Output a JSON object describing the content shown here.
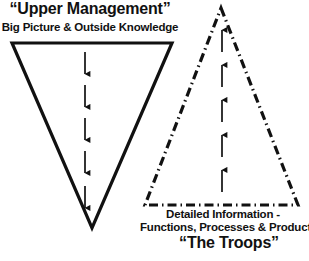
{
  "diagram": {
    "background_color": "#ffffff",
    "stroke_color": "#111111",
    "upper": {
      "title": "“Upper Management”",
      "subtitle": "Big Picture & Outside Knowledge",
      "shape": "inverted-triangle",
      "line_style": "solid",
      "arrow_direction": "down",
      "arrow_count": 5,
      "vertices": [
        [
          12,
          43
        ],
        [
          172,
          43
        ],
        [
          92,
          228
        ]
      ]
    },
    "lower": {
      "title": "“The Troops”",
      "caption_line_1": "Detailed Information -",
      "caption_line_2": "Functions, Processes & Products",
      "shape": "upright-triangle",
      "line_style": "dash-dot",
      "arrow_direction": "up",
      "arrow_count": 5,
      "vertices": [
        [
          221,
          8
        ],
        [
          298,
          205
        ],
        [
          145,
          205
        ]
      ]
    }
  }
}
